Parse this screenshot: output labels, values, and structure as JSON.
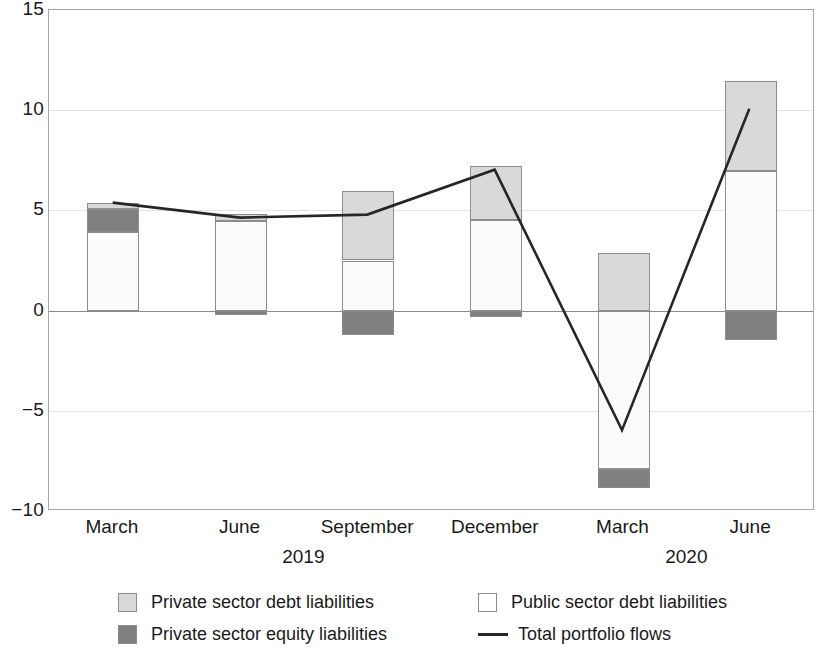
{
  "chart_data": {
    "type": "bar",
    "title": "",
    "subtitle": "",
    "xlabel": "",
    "ylabel": "",
    "ylim": [
      -10,
      15
    ],
    "yticks": [
      15,
      10,
      5,
      0,
      -5,
      -10
    ],
    "ytick_labels": [
      "15",
      "10",
      "5",
      "0",
      "−5",
      "−10"
    ],
    "grid": true,
    "stacked": true,
    "legend_position": "bottom",
    "categories": [
      "March",
      "June",
      "September",
      "December",
      "March",
      "June"
    ],
    "group_labels": [
      "2019",
      "2020"
    ],
    "group_spans": [
      4,
      2
    ],
    "series": [
      {
        "name": "Private sector debt liabilities",
        "type": "bar",
        "color": "#d9d9d9",
        "values": [
          0.3,
          0.35,
          6.0,
          7.2,
          2.85,
          11.45
        ]
      },
      {
        "name": "Public sector debt liabilities",
        "type": "bar",
        "color": "#ffffff",
        "values": [
          3.9,
          4.45,
          2.5,
          4.5,
          -7.9,
          6.95
        ]
      },
      {
        "name": "Private sector equity liabilities",
        "type": "bar",
        "color": "#808080",
        "values": [
          1.15,
          -0.2,
          -1.2,
          -0.3,
          -0.95,
          -1.45
        ]
      },
      {
        "name": "Total portfolio flows",
        "type": "line",
        "color": "#262626",
        "values": [
          5.35,
          4.6,
          4.75,
          7.0,
          -6.05,
          10.05
        ]
      }
    ],
    "bars": [
      {
        "category": "March",
        "year": "2019",
        "segments": [
          {
            "name": "Public sector debt liabilities",
            "from": 0.0,
            "to": 3.9
          },
          {
            "name": "Private sector equity liabilities",
            "from": 3.9,
            "to": 5.05
          },
          {
            "name": "Private sector debt liabilities",
            "from": 5.05,
            "to": 5.35
          }
        ]
      },
      {
        "category": "June",
        "year": "2019",
        "segments": [
          {
            "name": "Private sector equity liabilities",
            "from": -0.2,
            "to": 0.0
          },
          {
            "name": "Public sector debt liabilities",
            "from": 0.0,
            "to": 4.45
          },
          {
            "name": "Private sector debt liabilities",
            "from": 4.45,
            "to": 4.8
          }
        ]
      },
      {
        "category": "September",
        "year": "2019",
        "segments": [
          {
            "name": "Private sector equity liabilities",
            "from": -1.2,
            "to": 0.0
          },
          {
            "name": "Public sector debt liabilities",
            "from": 0.0,
            "to": 2.5
          },
          {
            "name": "Private sector debt liabilities",
            "from": 2.5,
            "to": 5.95
          }
        ]
      },
      {
        "category": "December",
        "year": "2019",
        "segments": [
          {
            "name": "Private sector equity liabilities",
            "from": -0.3,
            "to": 0.0
          },
          {
            "name": "Public sector debt liabilities",
            "from": 0.0,
            "to": 4.5
          },
          {
            "name": "Private sector debt liabilities",
            "from": 4.5,
            "to": 7.2
          }
        ]
      },
      {
        "category": "March",
        "year": "2020",
        "segments": [
          {
            "name": "Private sector equity liabilities",
            "from": -8.85,
            "to": -7.9
          },
          {
            "name": "Public sector debt liabilities",
            "from": -7.9,
            "to": 0.0
          },
          {
            "name": "Private sector debt liabilities",
            "from": 0.0,
            "to": 2.85
          }
        ]
      },
      {
        "category": "June",
        "year": "2020",
        "segments": [
          {
            "name": "Private sector equity liabilities",
            "from": -1.45,
            "to": 0.0
          },
          {
            "name": "Public sector debt liabilities",
            "from": 0.0,
            "to": 6.95
          },
          {
            "name": "Private sector debt liabilities",
            "from": 6.95,
            "to": 11.45
          }
        ]
      }
    ],
    "line": {
      "name": "Total portfolio flows",
      "points": [
        {
          "x": "March 2019",
          "y": 5.35
        },
        {
          "x": "June 2019",
          "y": 4.6
        },
        {
          "x": "September 2019",
          "y": 4.75
        },
        {
          "x": "December 2019",
          "y": 7.0
        },
        {
          "x": "March 2020",
          "y": -6.05
        },
        {
          "x": "June 2020",
          "y": 10.05
        }
      ]
    }
  },
  "legend": {
    "items": [
      {
        "label": "Private sector debt liabilities",
        "marker": "swatch-light",
        "color": "#d9d9d9"
      },
      {
        "label": "Public sector debt liabilities",
        "marker": "swatch-white",
        "color": "#ffffff"
      },
      {
        "label": "Private sector equity liabilities",
        "marker": "swatch-dark",
        "color": "#808080"
      },
      {
        "label": "Total portfolio flows",
        "marker": "line-marker",
        "color": "#262626"
      }
    ]
  }
}
